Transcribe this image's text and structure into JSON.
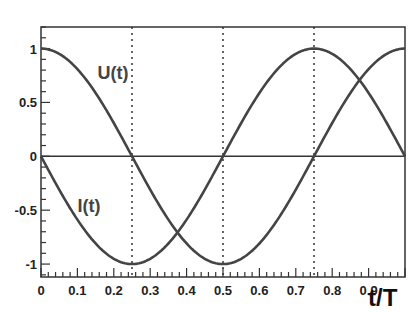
{
  "chart_data": {
    "type": "line",
    "title": "",
    "xlabel": "t/T",
    "ylabel": "",
    "xlim": [
      0,
      1
    ],
    "ylim": [
      -1.12,
      1.2
    ],
    "grid": false,
    "x_ticks": [
      0,
      0.1,
      0.2,
      0.3,
      0.4,
      0.5,
      0.6,
      0.7,
      0.8,
      0.9
    ],
    "x_tick_labels": [
      "0",
      "0.1",
      "0.2",
      "0.3",
      "0.4",
      "0.5",
      "0.6",
      "0.7",
      "0.8",
      "0.9"
    ],
    "y_ticks": [
      1,
      0.5,
      0,
      -0.5,
      -1
    ],
    "y_tick_labels": [
      "1",
      "0.5",
      "0",
      "-0.5",
      "-1"
    ],
    "vertical_dashed_lines": [
      0.25,
      0.5,
      0.75
    ],
    "zero_line": true,
    "series": [
      {
        "name": "U(t)",
        "function": "cos(2*pi*t)",
        "x": [
          0,
          0.05,
          0.1,
          0.15,
          0.2,
          0.25,
          0.3,
          0.35,
          0.4,
          0.45,
          0.5,
          0.55,
          0.6,
          0.65,
          0.7,
          0.75,
          0.8,
          0.85,
          0.9,
          0.95,
          1.0
        ],
        "values": [
          1,
          0.951,
          0.809,
          0.588,
          0.309,
          0,
          -0.309,
          -0.588,
          -0.809,
          -0.951,
          -1,
          -0.951,
          -0.809,
          -0.588,
          -0.309,
          0,
          0.309,
          0.588,
          0.809,
          0.951,
          1
        ],
        "color": "#444444",
        "label_position": {
          "x": 0.155,
          "y": 0.72
        }
      },
      {
        "name": "I(t)",
        "function": "-sin(2*pi*t)",
        "x": [
          0,
          0.05,
          0.1,
          0.15,
          0.2,
          0.25,
          0.3,
          0.35,
          0.4,
          0.45,
          0.5,
          0.55,
          0.6,
          0.65,
          0.7,
          0.75,
          0.8,
          0.85,
          0.9,
          0.95,
          1.0
        ],
        "values": [
          0,
          -0.309,
          -0.588,
          -0.809,
          -0.951,
          -1,
          -0.951,
          -0.809,
          -0.588,
          -0.309,
          0,
          0.309,
          0.588,
          0.809,
          0.951,
          1,
          0.951,
          0.809,
          0.588,
          0.309,
          0
        ],
        "color": "#444444",
        "label_position": {
          "x": 0.1,
          "y": -0.52
        }
      }
    ]
  },
  "colors": {
    "frame": "#333333",
    "curve": "#444444",
    "dashed": "#333333",
    "text": "#222222"
  }
}
